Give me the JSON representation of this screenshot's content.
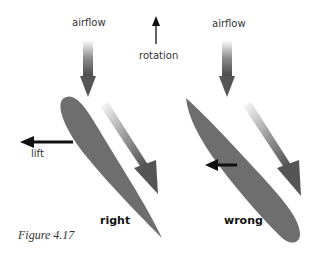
{
  "figure": {
    "caption": "Figure 4.17",
    "labels": {
      "airflow_left": "airflow",
      "airflow_right": "airflow",
      "rotation": "rotation",
      "lift": "lift",
      "right": "right",
      "wrong": "wrong"
    },
    "colors": {
      "airfoil": "#6e6e6e",
      "arrow": "#111111",
      "flow_arrow": "#555555"
    }
  }
}
